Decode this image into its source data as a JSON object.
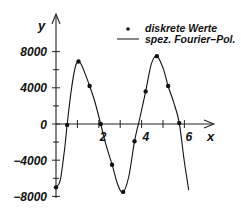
{
  "chart_data": {
    "type": "line",
    "title": "",
    "xlabel": "x",
    "ylabel": "y",
    "xlim": [
      0,
      6.8
    ],
    "ylim": [
      -8000,
      8000
    ],
    "grid": false,
    "legend_position": "top-right",
    "x_ticks": [
      {
        "value": 2,
        "label": "2"
      },
      {
        "value": 4,
        "label": "4"
      },
      {
        "value": 6,
        "label": "6"
      }
    ],
    "x_minor_ticks": [
      1,
      3,
      5
    ],
    "y_ticks": [
      {
        "value": 8000,
        "label": "8000"
      },
      {
        "value": 4000,
        "label": "4000"
      },
      {
        "value": 0,
        "label": "0"
      },
      {
        "value": -4000,
        "label": "-4000"
      },
      {
        "value": -8000,
        "label": "-8000"
      }
    ],
    "y_minor_ticks": [
      6000,
      2000,
      -2000,
      -6000
    ],
    "series": [
      {
        "name": "diskrete Werte",
        "kind": "points",
        "x": [
          0.0,
          0.52,
          1.05,
          1.57,
          2.09,
          2.62,
          3.14,
          3.67,
          4.19,
          4.71,
          5.24,
          5.76
        ],
        "values": [
          -7000,
          -100,
          6900,
          4200,
          0,
          -4500,
          -7500,
          -1900,
          3600,
          7500,
          4200,
          100
        ]
      },
      {
        "name": "spez. Fourier-Pol.",
        "kind": "curve",
        "x": [
          0.0,
          0.2,
          0.4,
          0.52,
          0.7,
          0.9,
          1.05,
          1.2,
          1.4,
          1.57,
          1.8,
          2.09,
          2.3,
          2.62,
          2.9,
          3.14,
          3.4,
          3.67,
          3.9,
          4.19,
          4.45,
          4.71,
          5.0,
          5.24,
          5.5,
          5.76,
          6.0,
          6.2
        ],
        "values": [
          -7000,
          -6200,
          -2800,
          -100,
          3500,
          6300,
          6900,
          6500,
          5300,
          4200,
          2600,
          0,
          -2000,
          -4500,
          -6800,
          -7500,
          -5800,
          -1900,
          500,
          3600,
          6600,
          7500,
          6200,
          4200,
          2400,
          100,
          -4200,
          -7300
        ]
      }
    ]
  },
  "legend": {
    "items": [
      {
        "symbol": "dot",
        "label": "diskrete Werte"
      },
      {
        "symbol": "line",
        "label": "spez. Fourier–Pol."
      }
    ]
  },
  "axes": {
    "x_title": "x",
    "y_title": "y"
  },
  "colors": {
    "ink": "#111111",
    "background": "#ffffff"
  }
}
